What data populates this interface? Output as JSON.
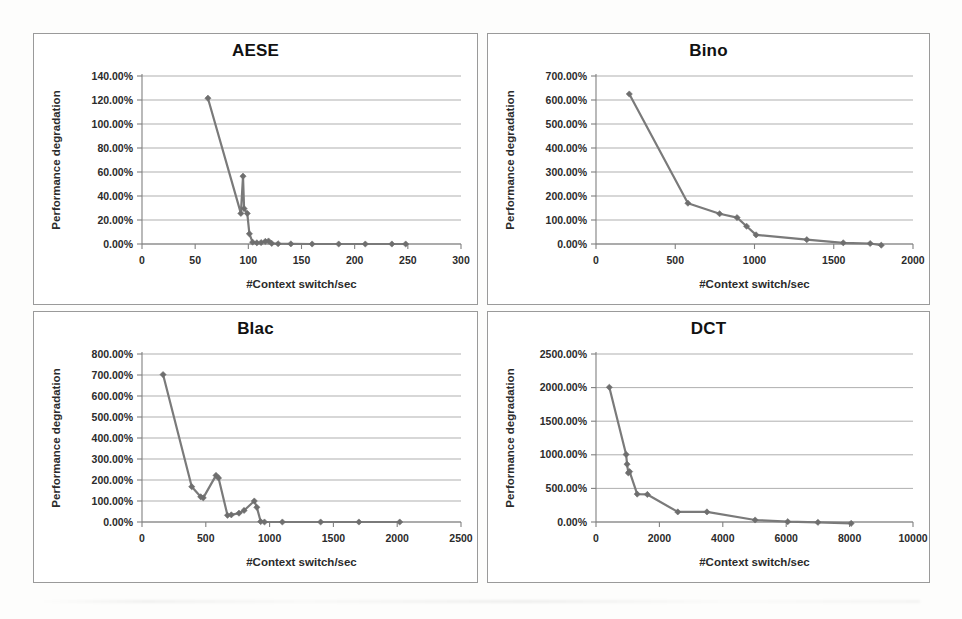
{
  "page": {
    "background_color": "#fdfdfc",
    "panel_border_color": "#9a9a9a",
    "series_color": "#6e6e6e",
    "gridline_color": "#a6a6a6"
  },
  "charts": [
    {
      "id": "aese",
      "title": "AESE",
      "type": "line",
      "xlabel": "#Context switch/sec",
      "ylabel": "Performance degradation",
      "xlim": [
        0,
        300
      ],
      "ylim": [
        0,
        1.4
      ],
      "xticks": [
        0,
        50,
        100,
        150,
        200,
        250,
        300
      ],
      "xticklabels": [
        "0",
        "50",
        "100",
        "150",
        "200",
        "250",
        "300"
      ],
      "yticks": [
        0,
        0.2,
        0.4,
        0.6,
        0.8,
        1.0,
        1.2,
        1.4
      ],
      "yticklabels": [
        "0.00%",
        "20.00%",
        "40.00%",
        "60.00%",
        "80.00%",
        "100.00%",
        "120.00%",
        "140.00%"
      ],
      "grid": true,
      "legend": false,
      "series": [
        {
          "name": "degradation",
          "x": [
            62,
            93,
            95,
            96,
            99,
            101,
            104,
            108,
            112,
            116,
            119,
            122,
            128,
            140,
            160,
            185,
            210,
            235,
            248
          ],
          "y": [
            1.215,
            0.255,
            0.565,
            0.295,
            0.255,
            0.085,
            0.015,
            0.01,
            0.012,
            0.022,
            0.025,
            0.005,
            0.002,
            0.001,
            0.0,
            0.0,
            0.0,
            0.0,
            0.0
          ]
        }
      ]
    },
    {
      "id": "bino",
      "title": "Bino",
      "type": "line",
      "xlabel": "#Context switch/sec",
      "ylabel": "Performance degradation",
      "xlim": [
        0,
        2000
      ],
      "ylim": [
        0,
        7.0
      ],
      "xticks": [
        0,
        500,
        1000,
        1500,
        2000
      ],
      "xticklabels": [
        "0",
        "500",
        "1000",
        "1500",
        "2000"
      ],
      "yticks": [
        0,
        1.0,
        2.0,
        3.0,
        4.0,
        5.0,
        6.0,
        7.0
      ],
      "yticklabels": [
        "0.00%",
        "100.00%",
        "200.00%",
        "300.00%",
        "400.00%",
        "500.00%",
        "600.00%",
        "700.00%"
      ],
      "grid": true,
      "legend": false,
      "series": [
        {
          "name": "degradation",
          "x": [
            210,
            580,
            780,
            890,
            950,
            1010,
            1330,
            1560,
            1730,
            1800
          ],
          "y": [
            6.25,
            1.7,
            1.26,
            1.1,
            0.74,
            0.38,
            0.18,
            0.05,
            0.02,
            -0.05
          ]
        }
      ]
    },
    {
      "id": "blac",
      "title": "Blac",
      "type": "line",
      "xlabel": "#Context switch/sec",
      "ylabel": "Performance degradation",
      "xlim": [
        0,
        2500
      ],
      "ylim": [
        0,
        8.0
      ],
      "xticks": [
        0,
        500,
        1000,
        1500,
        2000,
        2500
      ],
      "xticklabels": [
        "0",
        "500",
        "1000",
        "1500",
        "2000",
        "2500"
      ],
      "yticks": [
        0,
        1.0,
        2.0,
        3.0,
        4.0,
        5.0,
        6.0,
        7.0,
        8.0
      ],
      "yticklabels": [
        "0.00%",
        "100.00%",
        "200.00%",
        "300.00%",
        "400.00%",
        "500.00%",
        "600.00%",
        "700.00%",
        "800.00%"
      ],
      "grid": true,
      "legend": false,
      "series": [
        {
          "name": "degradation",
          "x": [
            165,
            390,
            460,
            480,
            580,
            600,
            670,
            700,
            760,
            800,
            880,
            900,
            930,
            960,
            1100,
            1400,
            1700,
            2020
          ],
          "y": [
            7.02,
            1.68,
            1.2,
            1.15,
            2.22,
            2.1,
            0.32,
            0.34,
            0.42,
            0.55,
            1.0,
            0.7,
            0.02,
            0.0,
            0.0,
            0.0,
            0.0,
            0.0
          ]
        }
      ]
    },
    {
      "id": "dct",
      "title": "DCT",
      "type": "line",
      "xlabel": "#Context switch/sec",
      "ylabel": "Performance degradation",
      "xlim": [
        0,
        10000
      ],
      "ylim": [
        0,
        25.0
      ],
      "xticks": [
        0,
        2000,
        4000,
        6000,
        8000,
        10000
      ],
      "xticklabels": [
        "0",
        "2000",
        "4000",
        "6000",
        "8000",
        "10000"
      ],
      "yticks": [
        0,
        5.0,
        10.0,
        15.0,
        20.0,
        25.0
      ],
      "yticklabels": [
        "0.00%",
        "500.00%",
        "1000.00%",
        "1500.00%",
        "2000.00%",
        "2500.00%"
      ],
      "grid": true,
      "legend": false,
      "series": [
        {
          "name": "degradation",
          "x": [
            420,
            950,
            980,
            1020,
            1060,
            1300,
            1620,
            2580,
            3500,
            5020,
            6050,
            7000,
            8050
          ],
          "y": [
            20.05,
            10.05,
            8.6,
            7.3,
            7.5,
            4.15,
            4.1,
            1.5,
            1.5,
            0.3,
            0.05,
            -0.05,
            -0.2
          ]
        }
      ]
    }
  ]
}
